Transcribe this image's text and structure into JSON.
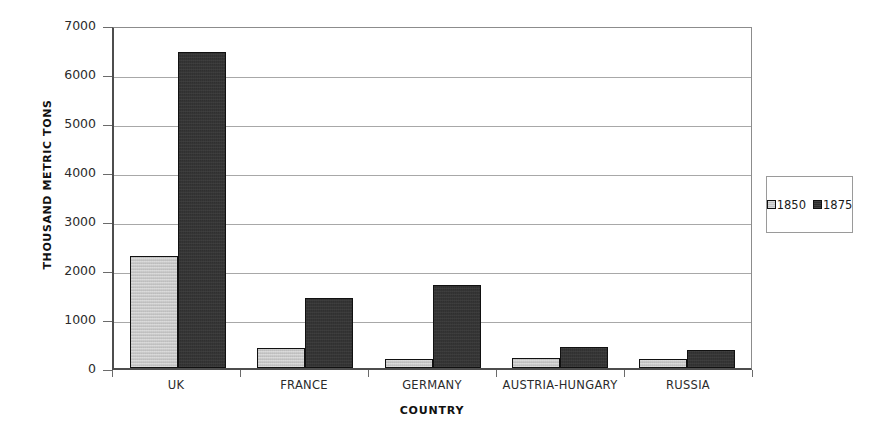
{
  "chart_data": {
    "type": "bar",
    "title": "",
    "xlabel": "COUNTRY",
    "ylabel": "THOUSAND METRIC TONS",
    "categories": [
      "UK",
      "FRANCE",
      "GERMANY",
      "AUSTRIA-HUNGARY",
      "RUSSIA"
    ],
    "series": [
      {
        "name": "1850",
        "color": "#c6c6c6",
        "values": [
          2280,
          400,
          190,
          210,
          180
        ]
      },
      {
        "name": "1875",
        "color": "#333333",
        "values": [
          6450,
          1430,
          1700,
          420,
          370
        ]
      }
    ],
    "ylim": [
      0,
      7000
    ],
    "ytick_values": [
      0,
      1000,
      2000,
      3000,
      4000,
      5000,
      6000,
      7000
    ],
    "ytick_labels": [
      "0",
      "1000",
      "2000",
      "3000",
      "4000",
      "5000",
      "6000",
      "7000"
    ],
    "grid": true,
    "legend_position": "right",
    "legend_entries": [
      "1850",
      "1875"
    ]
  }
}
